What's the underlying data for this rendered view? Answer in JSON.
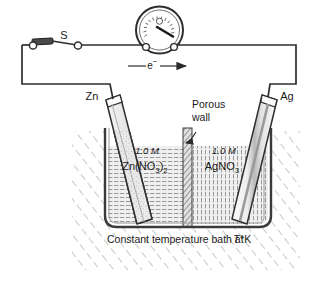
{
  "figure": {
    "caption": "Constant temperature bath at",
    "caption_temp": "T",
    "caption_unit": "°K"
  },
  "circuit": {
    "switch_label": "S",
    "electron_label": "e",
    "electron_charge": "−",
    "meter_name": "galvanometer"
  },
  "electrodes": {
    "left": {
      "label": "Zn",
      "name": "zinc-electrode"
    },
    "right": {
      "label": "Ag",
      "name": "silver-electrode"
    }
  },
  "solutions": {
    "left": {
      "concentration": "1.0 M",
      "formula_main": "Zn(NO",
      "formula_sub1": "3",
      "formula_mid": ")",
      "formula_sub2": "2"
    },
    "right": {
      "concentration": "1.0 M",
      "formula_main": "AgNO",
      "formula_sub1": "3"
    }
  },
  "annotations": {
    "porous_line1": "Porous",
    "porous_line2": "wall"
  },
  "colors": {
    "ink": "#1a1a1a",
    "line": "#3a3a3a",
    "hatch": "#8d8d8d",
    "solution": "#cfcfcf",
    "metal": "#d8d8d8",
    "background": "#ffffff"
  }
}
